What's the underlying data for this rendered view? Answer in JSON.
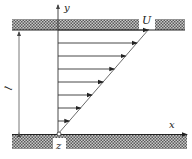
{
  "diagram": {
    "type": "couette-flow-velocity-profile",
    "labels": {
      "y_axis": "y",
      "x_axis": "x",
      "origin": "z",
      "top_velocity": "U",
      "gap_height": "l"
    },
    "profile": {
      "shape": "linear",
      "arrow_count": 8,
      "velocity_fraction_at_arrows": [
        1.0,
        0.875,
        0.75,
        0.625,
        0.5,
        0.375,
        0.25,
        0.125
      ]
    },
    "colors": {
      "line": "#222222",
      "hatch_dark": "#555555",
      "hatch_light": "#bbbbbb",
      "background": "#ffffff"
    }
  }
}
